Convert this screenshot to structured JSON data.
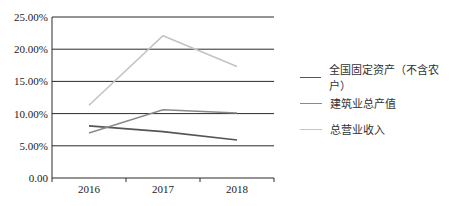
{
  "chart_data": {
    "type": "line",
    "title": "",
    "xlabel": "",
    "ylabel": "",
    "categories": [
      "2016",
      "2017",
      "2018"
    ],
    "ylim": [
      0,
      25
    ],
    "y_ticks": [
      "0.00",
      "5.00%",
      "10.00%",
      "15.00%",
      "20.00%",
      "25.00%"
    ],
    "grid": true,
    "legend_position": "right",
    "series": [
      {
        "name": "全国固定资产（不含农户）",
        "values": [
          8.1,
          7.2,
          5.9
        ],
        "color": "#555555"
      },
      {
        "name": "建筑业总产值",
        "values": [
          7.0,
          10.6,
          10.1
        ],
        "color": "#8a8a8a"
      },
      {
        "name": "总营业收入",
        "values": [
          11.3,
          22.1,
          17.3
        ],
        "color": "#c4c4c4"
      }
    ]
  }
}
